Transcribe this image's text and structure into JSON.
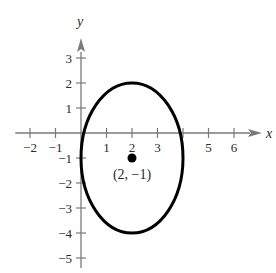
{
  "heading_fragment": "Example",
  "chart_data": {
    "type": "line",
    "title": "",
    "xlabel": "x",
    "ylabel": "y",
    "xlim": [
      -2.5,
      7
    ],
    "ylim": [
      -5.5,
      4
    ],
    "grid": false,
    "x_ticks": [
      -2,
      -1,
      1,
      2,
      3,
      5,
      6
    ],
    "x_tick_labels": [
      "−2",
      "−1",
      "1",
      "2",
      "3",
      "5",
      "6"
    ],
    "y_ticks": [
      3,
      2,
      1,
      -1,
      -2,
      -3,
      -4,
      -5
    ],
    "y_tick_labels": [
      "3",
      "2",
      "1",
      "−1",
      "−2",
      "−3",
      "−4",
      "−5"
    ],
    "series": [
      {
        "name": "ellipse",
        "shape": "ellipse",
        "center": [
          2,
          -1
        ],
        "semi_axis_x": 2,
        "semi_axis_y": 3,
        "equation": "(x-2)^2/4 + (y+1)^2/9 = 1",
        "x_range": [
          0,
          4
        ],
        "y_range": [
          -4,
          2
        ]
      }
    ],
    "points": [
      {
        "x": 2,
        "y": -1,
        "label": "(2, −1)"
      }
    ],
    "annotations": [
      "(2, −1)"
    ]
  },
  "colors": {
    "axis": "#7a7a7a",
    "curve": "#000000",
    "text": "#2a2a2a"
  }
}
